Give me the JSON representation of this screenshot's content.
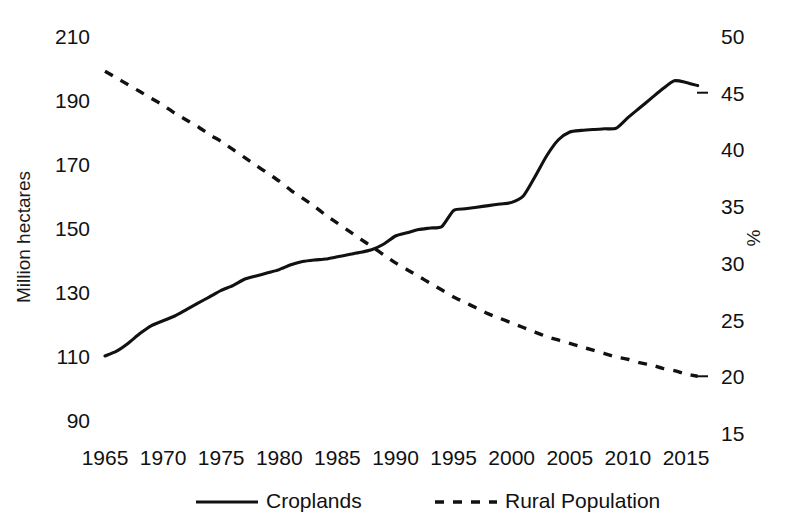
{
  "chart_data": {
    "type": "line",
    "title": "",
    "subtitle": "",
    "xlabel": "",
    "ylabel": "Million hectares",
    "y2label": "%",
    "xlim": [
      1963,
      2017
    ],
    "ylim": [
      90,
      210
    ],
    "y2lim": [
      15,
      50
    ],
    "grid": false,
    "legend_position": "bottom",
    "xticks": [
      "1965",
      "1970",
      "1975",
      "1980",
      "1985",
      "1990",
      "1995",
      "2000",
      "2005",
      "2010",
      "2015"
    ],
    "yticks": [
      "90",
      "110",
      "130",
      "150",
      "170",
      "190",
      "210"
    ],
    "y2ticks": [
      "15",
      "20",
      "25",
      "30",
      "35",
      "40",
      "45",
      "50"
    ],
    "series": [
      {
        "name": "Croplands",
        "axis": "left",
        "style": "solid",
        "color": "#111111",
        "unit": "Million hectares",
        "x": [
          1965,
          1966,
          1967,
          1968,
          1969,
          1970,
          1971,
          1972,
          1973,
          1974,
          1975,
          1976,
          1977,
          1978,
          1979,
          1980,
          1981,
          1982,
          1983,
          1984,
          1985,
          1986,
          1987,
          1988,
          1989,
          1990,
          1991,
          1992,
          1993,
          1994,
          1995,
          1996,
          1997,
          1998,
          1999,
          2000,
          2001,
          2002,
          2003,
          2004,
          2005,
          2006,
          2007,
          2008,
          2009,
          2010,
          2011,
          2012,
          2013,
          2014,
          2015,
          2016
        ],
        "values": [
          110.0,
          111.5,
          114.0,
          117.0,
          119.5,
          121.0,
          122.5,
          124.5,
          126.5,
          128.5,
          130.5,
          132.0,
          134.0,
          135.0,
          136.0,
          137.0,
          138.5,
          139.5,
          140.0,
          140.3,
          141.0,
          141.7,
          142.4,
          143.3,
          145.0,
          147.5,
          148.5,
          149.5,
          150.0,
          150.5,
          155.5,
          156.0,
          156.5,
          157.0,
          157.5,
          158.0,
          160.0,
          166.0,
          172.5,
          177.5,
          180.0,
          180.5,
          180.8,
          181.0,
          181.2,
          184.5,
          187.5,
          190.5,
          193.5,
          196.0,
          195.5,
          194.5
        ]
      },
      {
        "name": "Rural Population",
        "axis": "right",
        "style": "dashed",
        "color": "#111111",
        "unit": "%",
        "x": [
          1965,
          1966,
          1967,
          1968,
          1969,
          1970,
          1971,
          1972,
          1973,
          1974,
          1975,
          1976,
          1977,
          1978,
          1979,
          1980,
          1981,
          1982,
          1983,
          1984,
          1985,
          1986,
          1987,
          1988,
          1989,
          1990,
          1991,
          1992,
          1993,
          1994,
          1995,
          1996,
          1997,
          1998,
          1999,
          2000,
          2001,
          2002,
          2003,
          2004,
          2005,
          2006,
          2007,
          2008,
          2009,
          2010,
          2011,
          2012,
          2013,
          2014,
          2015,
          2016
        ],
        "values": [
          46.9,
          46.3,
          45.7,
          45.1,
          44.5,
          43.9,
          43.2,
          42.6,
          42.0,
          41.3,
          40.7,
          40.0,
          39.3,
          38.6,
          37.9,
          37.2,
          36.4,
          35.7,
          35.0,
          34.2,
          33.5,
          32.8,
          32.1,
          31.4,
          30.7,
          30.0,
          29.4,
          28.8,
          28.2,
          27.6,
          27.0,
          26.5,
          26.0,
          25.5,
          25.1,
          24.7,
          24.3,
          23.9,
          23.5,
          23.2,
          22.9,
          22.6,
          22.3,
          22.0,
          21.7,
          21.5,
          21.2,
          21.0,
          20.7,
          20.5,
          20.2,
          20.0
        ]
      }
    ],
    "annotations": [],
    "crossing_point": {
      "year": 1988,
      "left_value": 143.3,
      "right_value": 31.4
    }
  },
  "legend": {
    "items": [
      {
        "label": "Croplands",
        "marker": "solid-line-swatch"
      },
      {
        "label": "Rural Population",
        "marker": "dashed-line-swatch"
      }
    ]
  },
  "axes": {
    "left_title": "Million hectares",
    "right_title": "%"
  }
}
